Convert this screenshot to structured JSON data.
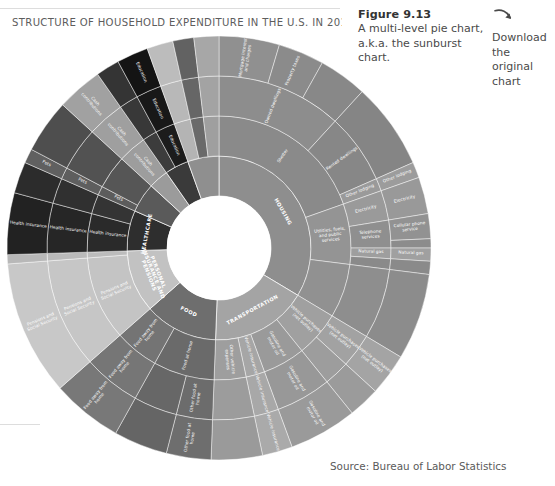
{
  "page": {
    "bleed_text": "",
    "source_note": "Source: Bureau of Labor Statistics"
  },
  "figure": {
    "number": "Figure 9.13",
    "description_line1": "A multi-level pie chart,",
    "description_line2": "a.k.a. the sunburst chart."
  },
  "download": {
    "icon": "download-curved-arrow-icon",
    "line1": "Download the",
    "line2": "original chart"
  },
  "chart_data": {
    "type": "pie",
    "subtype": "sunburst",
    "title": "STRUCTURE OF HOUSEHOLD EXPENDITURE IN THE U.S. IN 2012–201·",
    "title_truncated": true,
    "source": "Source: Bureau of Labor Statistics",
    "rings": 4,
    "legend": "none",
    "grid": false,
    "inner_radius_px": 52,
    "outer_radius_px": 212,
    "center_px": [
      219,
      248
    ],
    "start_angle_deg": 0,
    "direction": "clockwise",
    "categories": [
      {
        "label": "HOUSING",
        "value": 33.6,
        "color": "#8e8e8e",
        "children": [
          {
            "label": "Shelter",
            "value": 19.6,
            "color": "#8a8a8a",
            "children": [
              {
                "label": "Owned dwellings",
                "value": 11.8,
                "color": "#8d8d8d",
                "children": [
                  {
                    "label": "Mortgage interest and charges",
                    "value": 4.6,
                    "color": "#909090"
                  },
                  {
                    "label": "Property taxes",
                    "value": 3.5,
                    "color": "#8b8b8b"
                  },
                  {
                    "label": "",
                    "value": 3.7,
                    "color": "#888888"
                  }
                ]
              },
              {
                "label": "Rented dwellings",
                "value": 6.6,
                "color": "#878787",
                "children": [
                  {
                    "label": "",
                    "value": 6.6,
                    "color": "#858585"
                  }
                ]
              },
              {
                "label": "Other lodging",
                "value": 1.2,
                "color": "#9a9a9a",
                "children": [
                  {
                    "label": "Other lodging",
                    "value": 1.2,
                    "color": "#9c9c9c"
                  }
                ]
              }
            ]
          },
          {
            "label": "Utilities, fuels, and public services",
            "value": 7.4,
            "color": "#949494",
            "children": [
              {
                "label": "Electricity",
                "value": 2.8,
                "color": "#9a9a9a",
                "children": [
                  {
                    "label": "Electricity",
                    "value": 2.8,
                    "color": "#999999"
                  }
                ]
              },
              {
                "label": "Telephone services",
                "value": 2.6,
                "color": "#8f8f8f",
                "children": [
                  {
                    "label": "Cellular phone service",
                    "value": 1.9,
                    "color": "#929292"
                  },
                  {
                    "label": "",
                    "value": 0.7,
                    "color": "#8c8c8c"
                  }
                ]
              },
              {
                "label": "Natural gas",
                "value": 1.0,
                "color": "#9e9e9e",
                "children": [
                  {
                    "label": "Natural gas",
                    "value": 1.0,
                    "color": "#a0a0a0"
                  }
                ]
              },
              {
                "label": "",
                "value": 1.0,
                "color": "#8a8a8a",
                "children": [
                  {
                    "label": "",
                    "value": 1.0,
                    "color": "#8a8a8a"
                  }
                ]
              }
            ]
          },
          {
            "label": "",
            "value": 6.6,
            "color": "#919191",
            "children": [
              {
                "label": "",
                "value": 6.6,
                "color": "#8e8e8e",
                "children": [
                  {
                    "label": "",
                    "value": 6.6,
                    "color": "#8c8c8c"
                  }
                ]
              }
            ]
          }
        ]
      },
      {
        "label": "TRANSPORTATION",
        "value": 17.0,
        "color": "#a4a4a4",
        "children": [
          {
            "label": "Vehicle purchases (net outlay)",
            "value": 5.6,
            "color": "#a0a0a0",
            "children": [
              {
                "label": "Vehicle purchases (net outlay)",
                "value": 3.2,
                "color": "#a2a2a2",
                "children": [
                  {
                    "label": "Vehicle purchases (net outlay)",
                    "value": 3.2,
                    "color": "#a4a4a4"
                  }
                ]
              },
              {
                "label": "",
                "value": 2.4,
                "color": "#9d9d9d",
                "children": [
                  {
                    "label": "",
                    "value": 2.4,
                    "color": "#9b9b9b"
                  }
                ]
              }
            ]
          },
          {
            "label": "Gasoline and motor oil",
            "value": 5.2,
            "color": "#9a9a9a",
            "children": [
              {
                "label": "Gasoline and motor oil",
                "value": 5.2,
                "color": "#989898",
                "children": [
                  {
                    "label": "Gasoline and motor oil",
                    "value": 5.2,
                    "color": "#9a9a9a"
                  }
                ]
              }
            ]
          },
          {
            "label": "Vehicle insurance",
            "value": 2.3,
            "color": "#a6a6a6",
            "children": [
              {
                "label": "Vehicle insurance",
                "value": 2.3,
                "color": "#a8a8a8",
                "children": [
                  {
                    "label": "Vehicle insurance",
                    "value": 2.3,
                    "color": "#aaaaaa"
                  }
                ]
              }
            ]
          },
          {
            "label": "Other vehicle expenses",
            "value": 3.9,
            "color": "#9e9e9e",
            "children": [
              {
                "label": "",
                "value": 3.9,
                "color": "#9c9c9c",
                "children": [
                  {
                    "label": "",
                    "value": 3.9,
                    "color": "#9a9a9a"
                  }
                ]
              }
            ]
          }
        ]
      },
      {
        "label": "FOOD",
        "value": 12.9,
        "color": "#6e6e6e",
        "children": [
          {
            "label": "Food at home",
            "value": 7.5,
            "color": "#6a6a6a",
            "children": [
              {
                "label": "Other food at home",
                "value": 3.4,
                "color": "#6c6c6c",
                "children": [
                  {
                    "label": "Other food at home",
                    "value": 3.4,
                    "color": "#6e6e6e"
                  }
                ]
              },
              {
                "label": "",
                "value": 4.1,
                "color": "#676767",
                "children": [
                  {
                    "label": "",
                    "value": 4.1,
                    "color": "#656565"
                  }
                ]
              }
            ]
          },
          {
            "label": "Food away from home",
            "value": 5.4,
            "color": "#747474",
            "children": [
              {
                "label": "Food away from home",
                "value": 5.4,
                "color": "#767676",
                "children": [
                  {
                    "label": "Food away from home",
                    "value": 5.4,
                    "color": "#787878"
                  }
                ]
              }
            ]
          }
        ]
      },
      {
        "label": "PERSONAL INSURANCE AND PENSIONS",
        "value": 11.0,
        "color": "#c2c2c2",
        "children": [
          {
            "label": "Pensions and Social Security",
            "value": 10.3,
            "color": "#c4c4c4",
            "children": [
              {
                "label": "Pensions and Social Security",
                "value": 10.3,
                "color": "#c6c6c6",
                "children": [
                  {
                    "label": "Pensions and Social Security",
                    "value": 10.3,
                    "color": "#c8c8c8"
                  }
                ]
              }
            ]
          },
          {
            "label": "",
            "value": 0.7,
            "color": "#bcbcbc",
            "children": [
              {
                "label": "",
                "value": 0.7,
                "color": "#bababa",
                "children": [
                  {
                    "label": "",
                    "value": 0.7,
                    "color": "#b8b8b8"
                  }
                ]
              }
            ]
          }
        ]
      },
      {
        "label": "HEALTHCARE",
        "value": 7.1,
        "color": "#2e2e2e",
        "children": [
          {
            "label": "Health insurance",
            "value": 4.7,
            "color": "#2a2a2a",
            "children": [
              {
                "label": "Health insurance",
                "value": 4.7,
                "color": "#262626",
                "children": [
                  {
                    "label": "Health insurance",
                    "value": 4.7,
                    "color": "#222222"
                  }
                ]
              }
            ]
          },
          {
            "label": "",
            "value": 2.4,
            "color": "#343434",
            "children": [
              {
                "label": "",
                "value": 2.4,
                "color": "#303030",
                "children": [
                  {
                    "label": "",
                    "value": 2.4,
                    "color": "#2c2c2c"
                  }
                ]
              }
            ]
          }
        ]
      },
      {
        "label": "",
        "value": 5.2,
        "color": "#5a5a5a",
        "children": [
          {
            "label": "Pets",
            "value": 1.1,
            "color": "#5c5c5c",
            "children": [
              {
                "label": "Pets",
                "value": 1.1,
                "color": "#5e5e5e",
                "children": [
                  {
                    "label": "Pets",
                    "value": 1.1,
                    "color": "#606060"
                  }
                ]
              }
            ]
          },
          {
            "label": "",
            "value": 4.1,
            "color": "#565656",
            "children": [
              {
                "label": "",
                "value": 4.1,
                "color": "#525252",
                "children": [
                  {
                    "label": "",
                    "value": 4.1,
                    "color": "#4e4e4e"
                  }
                ]
              }
            ]
          }
        ]
      },
      {
        "label": "",
        "value": 3.5,
        "color": "#9b9b9b",
        "children": [
          {
            "label": "Cash contributions",
            "value": 3.5,
            "color": "#9d9d9d",
            "children": [
              {
                "label": "Cash contributions",
                "value": 3.5,
                "color": "#9f9f9f",
                "children": [
                  {
                    "label": "Cash contributions",
                    "value": 3.5,
                    "color": "#a1a1a1"
                  }
                ]
              }
            ]
          }
        ]
      },
      {
        "label": "",
        "value": 4.2,
        "color": "#3a3a3a",
        "children": [
          {
            "label": "",
            "value": 1.8,
            "color": "#3c3c3c",
            "children": [
              {
                "label": "",
                "value": 1.8,
                "color": "#383838",
                "children": [
                  {
                    "label": "",
                    "value": 1.8,
                    "color": "#343434"
                  }
                ]
              }
            ]
          },
          {
            "label": "Education",
            "value": 2.4,
            "color": "#1c1c1c",
            "children": [
              {
                "label": "Education",
                "value": 2.4,
                "color": "#181818",
                "children": [
                  {
                    "label": "Education",
                    "value": 2.4,
                    "color": "#141414"
                  }
                ]
              }
            ]
          }
        ]
      },
      {
        "label": "",
        "value": 5.5,
        "color": "#8f8f8f",
        "children": [
          {
            "label": "",
            "value": 2.0,
            "color": "#b4b4b4",
            "children": [
              {
                "label": "",
                "value": 2.0,
                "color": "#b8b8b8",
                "children": [
                  {
                    "label": "",
                    "value": 2.0,
                    "color": "#bcbcbc"
                  }
                ]
              }
            ]
          },
          {
            "label": "",
            "value": 1.6,
            "color": "#6a6a6a",
            "children": [
              {
                "label": "",
                "value": 1.6,
                "color": "#666666",
                "children": [
                  {
                    "label": "",
                    "value": 1.6,
                    "color": "#626262"
                  }
                ]
              }
            ]
          },
          {
            "label": "",
            "value": 1.9,
            "color": "#9f9f9f",
            "children": [
              {
                "label": "",
                "value": 1.9,
                "color": "#a3a3a3",
                "children": [
                  {
                    "label": "",
                    "value": 1.9,
                    "color": "#a7a7a7"
                  }
                ]
              }
            ]
          }
        ]
      }
    ]
  }
}
